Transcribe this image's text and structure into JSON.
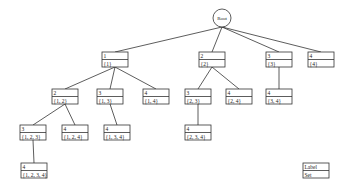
{
  "diagram": {
    "root": {
      "id": "root",
      "label": "Root"
    },
    "nodes": [
      {
        "id": "n1",
        "label": "1",
        "set": "{1}",
        "parent": "root"
      },
      {
        "id": "n2",
        "label": "2",
        "set": "{2}",
        "parent": "root"
      },
      {
        "id": "n3",
        "label": "3",
        "set": "{3}",
        "parent": "root"
      },
      {
        "id": "n4",
        "label": "4",
        "set": "{4}",
        "parent": "root"
      },
      {
        "id": "n12",
        "label": "2",
        "set": "{1, 2}",
        "parent": "n1"
      },
      {
        "id": "n13",
        "label": "3",
        "set": "{1, 3}",
        "parent": "n1"
      },
      {
        "id": "n14",
        "label": "4",
        "set": "{1, 4}",
        "parent": "n1"
      },
      {
        "id": "n23",
        "label": "3",
        "set": "{2, 3}",
        "parent": "n2"
      },
      {
        "id": "n24",
        "label": "4",
        "set": "{2, 4}",
        "parent": "n2"
      },
      {
        "id": "n34",
        "label": "4",
        "set": "{3, 4}",
        "parent": "n3"
      },
      {
        "id": "n123",
        "label": "3",
        "set": "{1, 2, 3}",
        "parent": "n12"
      },
      {
        "id": "n124",
        "label": "4",
        "set": "{1, 2, 4}",
        "parent": "n12"
      },
      {
        "id": "n134",
        "label": "4",
        "set": "{1, 3, 4}",
        "parent": "n13"
      },
      {
        "id": "n234",
        "label": "4",
        "set": "{2, 3, 4}",
        "parent": "n23"
      },
      {
        "id": "n1234",
        "label": "4",
        "set": "{1, 2, 3, 4}",
        "parent": "n123"
      }
    ],
    "legend": {
      "label": "Label",
      "set": "Set"
    }
  }
}
